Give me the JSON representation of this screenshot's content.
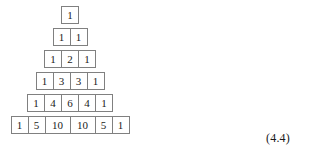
{
  "figure": {
    "name": "pascals-triangle",
    "background_color": "#ffffff",
    "cell_border_color": "#808080",
    "text_color": "#1a1a1a",
    "equation_label": "(4.4)",
    "rows": [
      {
        "index": 0,
        "values": [
          "1"
        ]
      },
      {
        "index": 1,
        "values": [
          "1",
          "1"
        ]
      },
      {
        "index": 2,
        "values": [
          "1",
          "2",
          "1"
        ]
      },
      {
        "index": 3,
        "values": [
          "1",
          "3",
          "3",
          "1"
        ]
      },
      {
        "index": 4,
        "values": [
          "1",
          "4",
          "6",
          "4",
          "1"
        ]
      },
      {
        "index": 5,
        "values": [
          "1",
          "5",
          "10",
          "10",
          "5",
          "1"
        ]
      }
    ]
  }
}
